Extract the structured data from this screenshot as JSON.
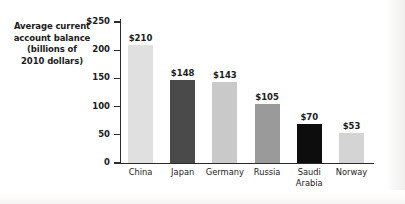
{
  "chart_data": {
    "type": "bar",
    "title": "Average current account balance (billions of 2010 dollars)",
    "title_lines": [
      "Average current",
      "account balance",
      "(billions of",
      "2010 dollars)"
    ],
    "xlabel": "",
    "ylabel": "Average current account balance (billions of 2010 dollars)",
    "ylim": [
      0,
      250
    ],
    "yticks": [
      0,
      50,
      100,
      150,
      200,
      250
    ],
    "ytick_labels": [
      "0",
      "50",
      "100",
      "150",
      "200",
      "$250"
    ],
    "grid": false,
    "legend": "none",
    "categories": [
      "China",
      "Japan",
      "Germany",
      "Russia",
      "Saudi Arabia",
      "Norway"
    ],
    "values": [
      210,
      148,
      143,
      105,
      70,
      53
    ],
    "value_labels": [
      "$210",
      "$148",
      "$143",
      "$105",
      "$70",
      "$53"
    ],
    "bar_colors": [
      "#e0e0e0",
      "#4a4a4a",
      "#c9c9c9",
      "#9a9a9a",
      "#0d0d0d",
      "#d4d4d4"
    ],
    "bars": [
      {
        "category": "China",
        "category_display": "China",
        "value": 210,
        "value_label": "$210",
        "color": "#e0e0e0"
      },
      {
        "category": "Japan",
        "category_display": "Japan",
        "value": 148,
        "value_label": "$148",
        "color": "#4a4a4a"
      },
      {
        "category": "Germany",
        "category_display": "Germany",
        "value": 143,
        "value_label": "$143",
        "color": "#c9c9c9"
      },
      {
        "category": "Russia",
        "category_display": "Russia",
        "value": 105,
        "value_label": "$105",
        "color": "#9a9a9a"
      },
      {
        "category": "Saudi Arabia",
        "category_display": "Saudi\nArabia",
        "value": 70,
        "value_label": "$70",
        "color": "#0d0d0d"
      },
      {
        "category": "Norway",
        "category_display": "Norway",
        "value": 53,
        "value_label": "$53",
        "color": "#d4d4d4"
      }
    ]
  },
  "colors": {
    "axis": "#2b2b2b",
    "text": "#1b1b1b",
    "background": "#ffffff"
  }
}
